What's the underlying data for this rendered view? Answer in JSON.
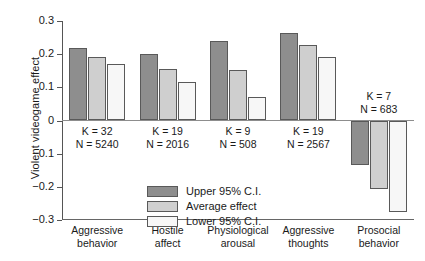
{
  "chart": {
    "type": "bar",
    "ylabel": "Violent videogame effect",
    "xlabel": "",
    "title": ""
  },
  "chart_data": {
    "type": "bar",
    "title": "",
    "xlabel": "",
    "ylabel": "Violent videogame effect",
    "ylim": [
      -0.3,
      0.3
    ],
    "yticks": [
      "0.3",
      "0.2",
      "0.1",
      "0",
      "−0.1",
      "−0.2",
      "−0.3"
    ],
    "ytick_values": [
      0.3,
      0.2,
      0.1,
      0,
      -0.1,
      -0.2,
      -0.3
    ],
    "grid": false,
    "legend_position": "inside-lower-left",
    "categories": [
      "Aggressive behavior",
      "Hostile affect",
      "Physiological arousal",
      "Aggressive thoughts",
      "Prosocial behavior"
    ],
    "series": [
      {
        "name": "Upper 95% C.I.",
        "color": "#8e8e8e",
        "values": [
          0.22,
          0.202,
          0.241,
          0.264,
          -0.133
        ]
      },
      {
        "name": "Average effect",
        "color": "#cfcfcf",
        "values": [
          0.192,
          0.155,
          0.153,
          0.229,
          -0.207
        ]
      },
      {
        "name": "Lower 95% C.I.",
        "color": "#f7f7f7",
        "values": [
          0.169,
          0.116,
          0.071,
          0.191,
          -0.277
        ]
      }
    ],
    "annotations": [
      {
        "category": "Aggressive behavior",
        "k": "K = 32",
        "n": "N = 5240"
      },
      {
        "category": "Hostile affect",
        "k": "K = 19",
        "n": "N = 2016"
      },
      {
        "category": "Physiological arousal",
        "k": "K = 9",
        "n": "N = 508"
      },
      {
        "category": "Aggressive thoughts",
        "k": "K = 19",
        "n": "N = 2567"
      },
      {
        "category": "Prosocial behavior",
        "k": "K = 7",
        "n": "N = 683"
      }
    ]
  },
  "axis": {
    "ticks": [
      {
        "label": "0.3"
      },
      {
        "label": "0.2"
      },
      {
        "label": "0.1"
      },
      {
        "label": "0"
      },
      {
        "label": "−0.1"
      },
      {
        "label": "−0.2"
      },
      {
        "label": "−0.3"
      }
    ]
  },
  "groups": [
    {
      "id": "aggressive-behavior",
      "cat_line1": "Aggressive",
      "cat_line2": "behavior",
      "k": "K = 32",
      "n": "N = 5240"
    },
    {
      "id": "hostile-affect",
      "cat_line1": "Hostile",
      "cat_line2": "affect",
      "k": "K = 19",
      "n": "N = 2016"
    },
    {
      "id": "physiological-arousal",
      "cat_line1": "Physiological",
      "cat_line2": "arousal",
      "k": "K = 9",
      "n": "N = 508"
    },
    {
      "id": "aggressive-thoughts",
      "cat_line1": "Aggressive",
      "cat_line2": "thoughts",
      "k": "K = 19",
      "n": "N = 2567"
    },
    {
      "id": "prosocial-behavior",
      "cat_line1": "Prosocial",
      "cat_line2": "behavior",
      "k": "K = 7",
      "n": "N = 683"
    }
  ],
  "legend": {
    "items": [
      {
        "label": "Upper 95% C.I.",
        "color": "#8e8e8e"
      },
      {
        "label": "Average effect",
        "color": "#cfcfcf"
      },
      {
        "label": "Lower 95% C.I.",
        "color": "#f7f7f7"
      }
    ]
  }
}
